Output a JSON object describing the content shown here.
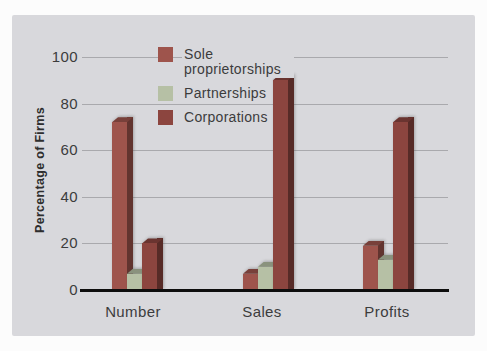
{
  "chart_data": {
    "type": "bar",
    "title": "",
    "ylabel": "Percentage of Firms",
    "xlabel": "",
    "categories": [
      "Number",
      "Sales",
      "Profits"
    ],
    "series": [
      {
        "name": "Sole proprietorships",
        "color": "#9e544c",
        "values": [
          72,
          7,
          19
        ]
      },
      {
        "name": "Partnerships",
        "color": "#b6c0a5",
        "values": [
          7,
          10,
          13
        ]
      },
      {
        "name": "Corporations",
        "color": "#8c453f",
        "values": [
          20,
          90,
          72
        ]
      }
    ],
    "ylim": [
      0,
      100
    ],
    "yticks": [
      0,
      20,
      40,
      60,
      80,
      100
    ],
    "grid": true,
    "legend_position": "top-center",
    "style": "3d-extruded-bars"
  },
  "colors": {
    "panel_bg": "#d8d8dc",
    "gridline": "#a9a9ad",
    "axis_line": "#0e0e0e",
    "text": "#3c3c3c"
  }
}
